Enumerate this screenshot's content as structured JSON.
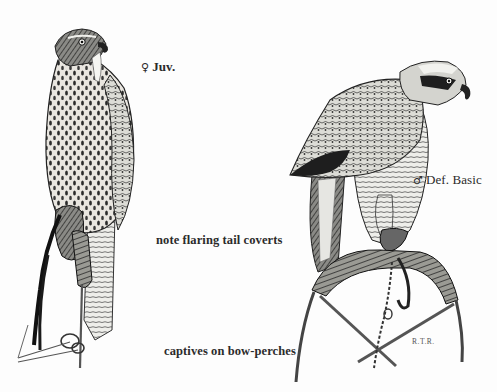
{
  "illustration": {
    "style": "pen-and-ink field guide plate",
    "background_color": "#fdfdfd",
    "ink_color": "#1f1f1f"
  },
  "labels": {
    "juvenile": {
      "symbol": "♀",
      "text": "Juv."
    },
    "adult": {
      "symbol": "♂",
      "text": "Def. Basic"
    },
    "tail_note": "note flaring tail coverts",
    "perch_note": "captives on bow-perches"
  },
  "signature": "R.T.R.",
  "figures": [
    {
      "id": "left-hawk",
      "description": "juvenile female hawk, heavily streaked breast, perched upright on bow-perch with jesses and leash"
    },
    {
      "id": "right-hawk",
      "description": "adult male hawk in definitive basic plumage, dark cap and eyestripe, hunched forward on padded bow-perch"
    }
  ]
}
